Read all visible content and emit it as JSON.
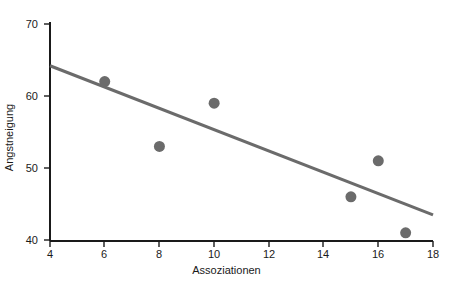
{
  "chart_data": {
    "type": "scatter",
    "title": "",
    "xlabel": "Assoziationen",
    "ylabel": "Angstneigung",
    "xlim": [
      4,
      18
    ],
    "ylim": [
      40,
      70
    ],
    "xticks": [
      4,
      6,
      8,
      10,
      12,
      14,
      16,
      18
    ],
    "yticks": [
      40,
      50,
      60,
      70
    ],
    "xtick_labels": [
      "4",
      "6",
      "8",
      "10",
      "12",
      "14",
      "16",
      "18"
    ],
    "ytick_labels": [
      "40",
      "50",
      "60",
      "70"
    ],
    "grid": false,
    "legend": null,
    "points": [
      {
        "x": 6,
        "y": 62
      },
      {
        "x": 8,
        "y": 53
      },
      {
        "x": 10,
        "y": 59
      },
      {
        "x": 15,
        "y": 46
      },
      {
        "x": 16,
        "y": 51
      },
      {
        "x": 17,
        "y": 41
      }
    ],
    "series": [
      {
        "name": "Datenpunkte",
        "type": "scatter",
        "x": [
          6,
          8,
          10,
          15,
          16,
          17
        ],
        "values": [
          62,
          53,
          59,
          46,
          51,
          41
        ],
        "marker": "circle",
        "marker_size": 11,
        "color": "#6b6b6b"
      },
      {
        "name": "Regressionsgerade",
        "type": "line",
        "x": [
          4,
          18
        ],
        "values": [
          64.2,
          43.5
        ],
        "color": "#6b6b6b",
        "width": 3
      }
    ],
    "axis_color": "#1a1a1a",
    "marker_color": "#6b6b6b",
    "line_color": "#6b6b6b"
  }
}
